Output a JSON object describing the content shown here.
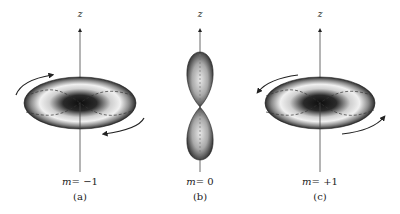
{
  "figure": {
    "panels": [
      {
        "id": "a",
        "axis_label": "z",
        "m_prefix": "m",
        "m_value": "= −1",
        "caption": "(a)",
        "shape": "torus",
        "rotation": "counterclockwise-from-top"
      },
      {
        "id": "b",
        "axis_label": "z",
        "m_prefix": "m",
        "m_value": "= 0",
        "caption": "(b)",
        "shape": "dumbbell"
      },
      {
        "id": "c",
        "axis_label": "z",
        "m_prefix": "m",
        "m_value": "= +1",
        "caption": "(c)",
        "shape": "torus",
        "rotation": "clockwise-from-top"
      }
    ],
    "colors": {
      "axis": "#333333",
      "shape_dark": "#111111",
      "shape_light": "#f2f2f2",
      "arrow": "#222222",
      "dashed": "#333333"
    }
  }
}
